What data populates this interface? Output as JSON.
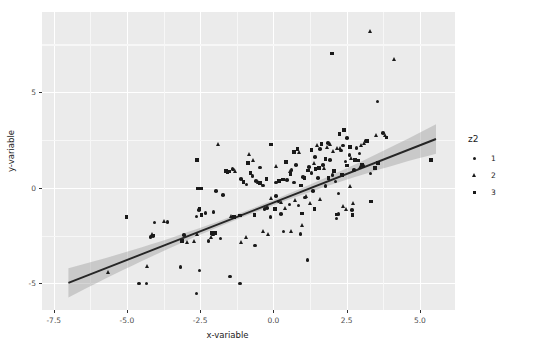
{
  "chart_data": {
    "type": "scatter",
    "title": "",
    "xlabel": "x-variable",
    "ylabel": "y-variable",
    "xlim": [
      -7.9,
      6.2
    ],
    "ylim": [
      -6.4,
      9.2
    ],
    "xticks": [
      "-7.5",
      "-5.0",
      "-2.5",
      "0.0",
      "2.5",
      "5.0"
    ],
    "xtick_values": [
      -7.5,
      -5.0,
      -2.5,
      0.0,
      2.5,
      5.0
    ],
    "yticks": [
      "5",
      "0",
      "-5"
    ],
    "ytick_values": [
      5,
      0,
      -5
    ],
    "grid": true,
    "legend": {
      "title": "z2",
      "position": "right",
      "entries": [
        {
          "label": "1",
          "shape": "circle"
        },
        {
          "label": "2",
          "shape": "triangle"
        },
        {
          "label": "3",
          "shape": "square"
        }
      ]
    },
    "fit": {
      "type": "linear",
      "slope": 0.6,
      "intercept": -0.78,
      "band": "confidence",
      "x_start": -7.0,
      "x_end": 5.55,
      "y_start": -4.98,
      "y_end": 2.55,
      "se_start": 0.45,
      "se_end": 0.42,
      "se_mid": 0.13,
      "line_color": "#262626",
      "band_color": "#9a9a9a"
    },
    "panel_background": "#ebebeb",
    "gridline_color": "#ffffff",
    "point_color": "#1a1a1a",
    "series": [
      {
        "name": "1",
        "shape": "circle",
        "points": [
          [
            -4.33,
            -5.02
          ],
          [
            -3.17,
            -4.14
          ],
          [
            -2.62,
            -5.54
          ],
          [
            -2.52,
            -4.34
          ],
          [
            -2.22,
            -2.79
          ],
          [
            -1.48,
            -4.64
          ],
          [
            -1.15,
            -5.01
          ],
          [
            -0.62,
            -3.02
          ],
          [
            -3.05,
            -2.47
          ],
          [
            -4.06,
            -1.82
          ],
          [
            -4.12,
            -2.52
          ],
          [
            -4.2,
            -2.58
          ],
          [
            -4.59,
            -5.02
          ],
          [
            -3.62,
            -1.78
          ],
          [
            -2.62,
            -1.5
          ],
          [
            -2.55,
            -1.16
          ],
          [
            -2.32,
            -1.32
          ],
          [
            -1.96,
            -0.16
          ],
          [
            -1.72,
            -0.38
          ],
          [
            -1.4,
            0.97
          ],
          [
            -1.36,
            0.95
          ],
          [
            -1.1,
            0.45
          ],
          [
            -0.92,
            0.18
          ],
          [
            -0.72,
            0.62
          ],
          [
            -0.6,
            0.34
          ],
          [
            -0.35,
            0.11
          ],
          [
            -0.3,
            -1.1
          ],
          [
            -0.1,
            -1.54
          ],
          [
            0.08,
            0.28
          ],
          [
            0.18,
            -0.72
          ],
          [
            0.34,
            -2.3
          ],
          [
            0.46,
            0.42
          ],
          [
            0.55,
            -0.88
          ],
          [
            0.62,
            0.94
          ],
          [
            0.7,
            0.27
          ],
          [
            0.78,
            1.2
          ],
          [
            0.86,
            -0.94
          ],
          [
            0.92,
            -2.42
          ],
          [
            1.02,
            0.56
          ],
          [
            1.08,
            -0.52
          ],
          [
            1.16,
            -3.78
          ],
          [
            1.22,
            1.1
          ],
          [
            1.3,
            0.76
          ],
          [
            1.42,
            1.62
          ],
          [
            1.52,
            0.52
          ],
          [
            1.6,
            2.02
          ],
          [
            1.7,
            1.18
          ],
          [
            1.78,
            0.08
          ],
          [
            1.86,
            2.34
          ],
          [
            1.94,
            1.46
          ],
          [
            2.02,
            0.66
          ],
          [
            2.12,
            0.32
          ],
          [
            2.22,
            -0.3
          ],
          [
            2.3,
            1.96
          ],
          [
            2.38,
            2.22
          ],
          [
            2.46,
            1.38
          ],
          [
            2.52,
            2.6
          ],
          [
            2.6,
            1.7
          ],
          [
            2.68,
            -1.18
          ],
          [
            2.76,
            0.94
          ],
          [
            2.84,
            2.08
          ],
          [
            2.94,
            1.8
          ],
          [
            3.06,
            1.14
          ],
          [
            3.16,
            2.46
          ],
          [
            3.32,
            0.74
          ],
          [
            3.55,
            4.52
          ],
          [
            3.74,
            2.88
          ],
          [
            2.16,
            -1.62
          ],
          [
            -1.8,
            -2.66
          ],
          [
            -2.05,
            -1.26
          ],
          [
            -0.22,
            -1.06
          ],
          [
            0.26,
            -1.36
          ],
          [
            0.08,
            -0.42
          ],
          [
            -0.46,
            1.05
          ],
          [
            1.36,
            -0.16
          ],
          [
            2.22,
            -1.36
          ]
        ]
      },
      {
        "name": "2",
        "shape": "triangle",
        "points": [
          [
            -5.62,
            -4.42
          ],
          [
            -4.3,
            -4.1
          ],
          [
            -4.12,
            -2.42
          ],
          [
            -3.72,
            -1.74
          ],
          [
            -2.94,
            -2.84
          ],
          [
            -2.7,
            -2.8
          ],
          [
            -2.6,
            -2.46
          ],
          [
            -2.12,
            -2.58
          ],
          [
            -2.04,
            -2.46
          ],
          [
            -1.86,
            2.28
          ],
          [
            -1.42,
            -1.48
          ],
          [
            -1.3,
            0.86
          ],
          [
            -0.92,
            -2.62
          ],
          [
            -0.8,
            1.72
          ],
          [
            -0.68,
            1.44
          ],
          [
            -0.52,
            0.3
          ],
          [
            -0.34,
            -2.28
          ],
          [
            -0.18,
            -2.46
          ],
          [
            0.1,
            1.1
          ],
          [
            0.26,
            -0.78
          ],
          [
            0.42,
            -1.1
          ],
          [
            0.58,
            0.86
          ],
          [
            0.74,
            -0.68
          ],
          [
            0.9,
            1.84
          ],
          [
            1.0,
            -1.96
          ],
          [
            1.14,
            -0.44
          ],
          [
            1.26,
            -0.82
          ],
          [
            1.42,
            1.26
          ],
          [
            1.5,
            2.2
          ],
          [
            1.62,
            -0.62
          ],
          [
            1.74,
            1.02
          ],
          [
            1.86,
            2.1
          ],
          [
            1.96,
            2.26
          ],
          [
            2.04,
            1.92
          ],
          [
            2.18,
            2.04
          ],
          [
            2.28,
            2.08
          ],
          [
            2.4,
            -0.96
          ],
          [
            2.5,
            -1.12
          ],
          [
            2.62,
            0.08
          ],
          [
            2.66,
            1.56
          ],
          [
            2.74,
            -0.84
          ],
          [
            2.96,
            1.04
          ],
          [
            3.12,
            2.32
          ],
          [
            3.3,
            8.18
          ],
          [
            3.52,
            2.72
          ],
          [
            3.82,
            2.74
          ],
          [
            4.12,
            6.7
          ],
          [
            3.02,
            2.24
          ],
          [
            -1.1,
            -2.88
          ],
          [
            0.62,
            -2.26
          ],
          [
            -0.06,
            -0.56
          ]
        ]
      },
      {
        "name": "3",
        "shape": "square",
        "points": [
          [
            -5.02,
            -1.52
          ],
          [
            -4.12,
            -2.5
          ],
          [
            -3.12,
            -2.8
          ],
          [
            -2.6,
            1.44
          ],
          [
            -2.58,
            -0.04
          ],
          [
            -2.46,
            -0.04
          ],
          [
            -2.52,
            -1.08
          ],
          [
            -2.46,
            -1.44
          ],
          [
            -2.1,
            -2.36
          ],
          [
            -2.0,
            -2.36
          ],
          [
            -1.56,
            0.82
          ],
          [
            -1.5,
            0.84
          ],
          [
            -1.34,
            -1.52
          ],
          [
            -1.14,
            -1.46
          ],
          [
            -0.86,
            1.3
          ],
          [
            -0.78,
            0.76
          ],
          [
            -0.64,
            -1.44
          ],
          [
            -0.46,
            0.24
          ],
          [
            -0.24,
            0.46
          ],
          [
            -0.08,
            2.26
          ],
          [
            0.06,
            -1.12
          ],
          [
            0.2,
            0.36
          ],
          [
            0.32,
            0.44
          ],
          [
            0.44,
            1.36
          ],
          [
            0.58,
            0.72
          ],
          [
            0.7,
            1.88
          ],
          [
            0.82,
            2.02
          ],
          [
            0.94,
            0.12
          ],
          [
            1.06,
            0.52
          ],
          [
            1.18,
            0.9
          ],
          [
            1.3,
            1.98
          ],
          [
            1.44,
            0.98
          ],
          [
            1.56,
            1.04
          ],
          [
            1.64,
            2.3
          ],
          [
            1.78,
            1.52
          ],
          [
            1.88,
            0.52
          ],
          [
            2.0,
            7.02
          ],
          [
            2.06,
            0.88
          ],
          [
            2.16,
            -1.4
          ],
          [
            2.26,
            2.82
          ],
          [
            2.34,
            0.68
          ],
          [
            2.42,
            3.02
          ],
          [
            2.52,
            1.16
          ],
          [
            2.62,
            2.12
          ],
          [
            2.7,
            -1.42
          ],
          [
            2.78,
            1.44
          ],
          [
            2.88,
            1.42
          ],
          [
            3.02,
            1.18
          ],
          [
            3.2,
            2.46
          ],
          [
            3.34,
            -0.72
          ],
          [
            3.46,
            1.02
          ],
          [
            3.58,
            1.3
          ],
          [
            3.86,
            2.64
          ],
          [
            5.38,
            1.46
          ],
          [
            1.4,
            -1.1
          ],
          [
            0.98,
            -1.34
          ],
          [
            -1.62,
            0.88
          ],
          [
            -1.02,
            0.3
          ]
        ]
      }
    ]
  }
}
